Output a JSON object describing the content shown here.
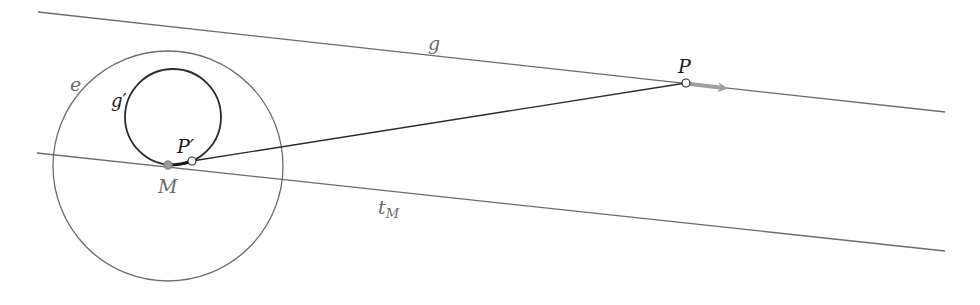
{
  "diagram": {
    "labels": {
      "line_g": "g",
      "image_curve": "g′",
      "circle_e": "e",
      "point_P": "P",
      "point_P_image": "P′",
      "point_M": "M",
      "tangent_t": "t",
      "tangent_sub": "M"
    },
    "colors": {
      "line": "#6b6b6b",
      "curve": "#2a2a2a",
      "arrow": "#a0a0a0",
      "point_M_fill": "#9a9a9a",
      "point_open_fill": "#ffffff",
      "label_dark": "#1a1a1a",
      "label_gray": "#6b6b6b"
    },
    "elements": {
      "line_g": {
        "x1": 38,
        "y1": 12,
        "x2": 945,
        "y2": 112
      },
      "tangent_tM": {
        "x1": 37,
        "y1": 153,
        "x2": 945,
        "y2": 251
      },
      "circle_e": {
        "cx": 168,
        "cy": 166,
        "r": 115
      },
      "circle_g_prime": {
        "cx": 173,
        "cy": 117,
        "r": 48
      },
      "segment_P_Pprime": {
        "x1": 686,
        "y1": 83,
        "x2": 192,
        "y2": 161
      },
      "point_M": {
        "x": 168,
        "y": 165
      },
      "point_P_prime": {
        "x": 192,
        "y": 161
      },
      "point_P": {
        "x": 686,
        "y": 83
      },
      "arrow_at_P": {
        "from_x": 690,
        "from_y": 84,
        "to_x": 728,
        "to_y": 88
      }
    }
  }
}
